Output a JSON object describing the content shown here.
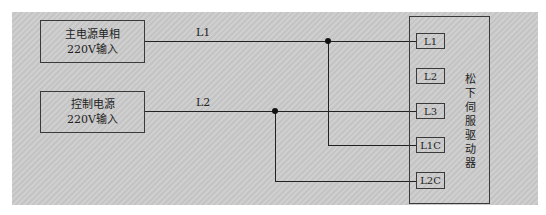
{
  "sources": [
    {
      "line1": "主电源单相",
      "line2": "220V输入"
    },
    {
      "line1": "控制电源",
      "line2": "220V输入"
    }
  ],
  "wire_labels": [
    "L1",
    "L2"
  ],
  "driver": {
    "title": "松下伺服驱动器",
    "terminals": [
      "L1",
      "L2",
      "L3",
      "L1C",
      "L2C"
    ]
  },
  "colors": {
    "line": "#222222",
    "background": "#c8c8c8"
  }
}
